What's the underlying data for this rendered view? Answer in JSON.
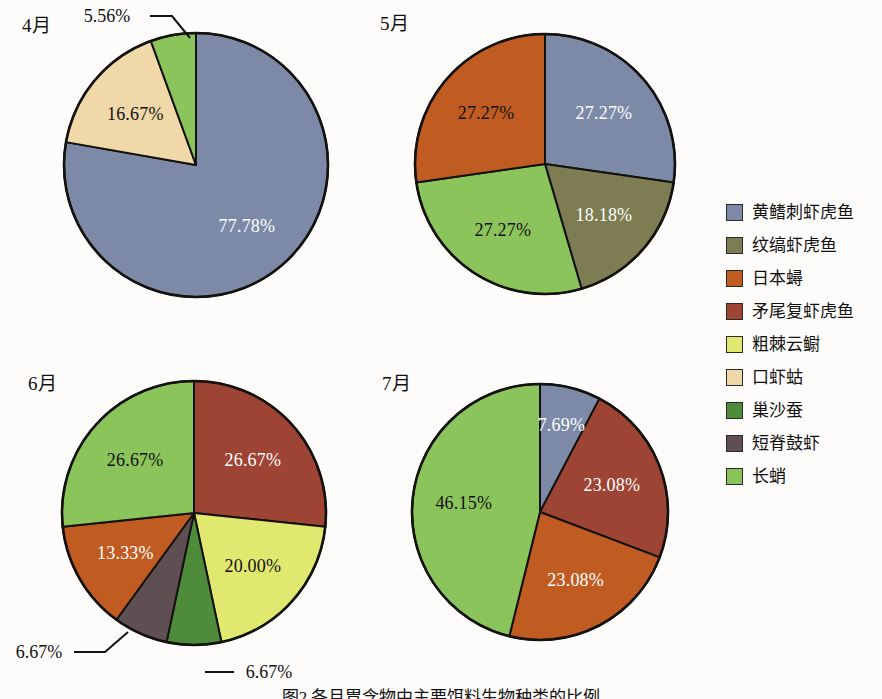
{
  "figure": {
    "caption": "图2  各月胃含物中主要饵料生物种类的比例",
    "legend_title": ""
  },
  "legend": {
    "items": [
      {
        "label": "黄鳍刺虾虎鱼",
        "color": "#7c8aa8"
      },
      {
        "label": "纹缟虾虎鱼",
        "color": "#7d7c52"
      },
      {
        "label": "日本蟳",
        "color": "#c05c22"
      },
      {
        "label": "矛尾复虾虎鱼",
        "color": "#9e4434"
      },
      {
        "label": "粗棘云鳚",
        "color": "#e0e870"
      },
      {
        "label": "口虾蛄",
        "color": "#f0d8a8"
      },
      {
        "label": "巢沙蚕",
        "color": "#4e8c3c"
      },
      {
        "label": "短脊鼓虾",
        "color": "#5f4f52"
      },
      {
        "label": "长蛸",
        "color": "#8cc45c"
      }
    ]
  },
  "chart_data": [
    {
      "type": "pie",
      "title": "4月",
      "labels": [
        "黄鳍刺虾虎鱼",
        "口虾蛄",
        "长蛸"
      ],
      "values": [
        77.78,
        16.67,
        5.56
      ],
      "value_labels": [
        "77.78%",
        "16.67%",
        "5.56%"
      ],
      "colors": [
        "#7c8aa8",
        "#f0d8a8",
        "#8cc45c"
      ],
      "label_placement": [
        "inside",
        "inside",
        "callout"
      ],
      "label_color": [
        "light",
        "dark",
        "dark"
      ],
      "start_angle_deg": 0,
      "direction": "clockwise"
    },
    {
      "type": "pie",
      "title": "5月",
      "labels": [
        "黄鳍刺虾虎鱼",
        "纹缟虾虎鱼",
        "长蛸",
        "日本蟳"
      ],
      "values": [
        27.27,
        18.18,
        27.27,
        27.27
      ],
      "value_labels": [
        "27.27%",
        "18.18%",
        "27.27%",
        "27.27%"
      ],
      "colors": [
        "#7c8aa8",
        "#7d7c52",
        "#8cc45c",
        "#c05c22"
      ],
      "label_placement": [
        "inside",
        "inside",
        "inside",
        "inside"
      ],
      "label_color": [
        "light",
        "light",
        "dark",
        "dark"
      ],
      "start_angle_deg": 0,
      "direction": "clockwise"
    },
    {
      "type": "pie",
      "title": "6月",
      "labels": [
        "矛尾复虾虎鱼",
        "粗棘云鳚",
        "巢沙蚕",
        "短脊鼓虾",
        "日本蟳",
        "长蛸"
      ],
      "values": [
        26.67,
        20.0,
        6.67,
        6.67,
        13.33,
        26.67
      ],
      "value_labels": [
        "26.67%",
        "20.00%",
        "6.67%",
        "6.67%",
        "13.33%",
        "26.67%"
      ],
      "colors": [
        "#9e4434",
        "#e0e870",
        "#4e8c3c",
        "#5f4f52",
        "#c05c22",
        "#8cc45c"
      ],
      "label_placement": [
        "inside",
        "inside",
        "callout",
        "callout",
        "inside",
        "inside"
      ],
      "label_color": [
        "light",
        "dark",
        "dark",
        "dark",
        "light",
        "dark"
      ],
      "start_angle_deg": 0,
      "direction": "clockwise"
    },
    {
      "type": "pie",
      "title": "7月",
      "labels": [
        "黄鳍刺虾虎鱼",
        "矛尾复虾虎鱼",
        "日本蟳",
        "长蛸"
      ],
      "values": [
        7.69,
        23.08,
        23.08,
        46.15
      ],
      "value_labels": [
        "7.69%",
        "23.08%",
        "23.08%",
        "46.15%"
      ],
      "colors": [
        "#7c8aa8",
        "#9e4434",
        "#c05c22",
        "#8cc45c"
      ],
      "label_placement": [
        "inside",
        "inside",
        "inside",
        "inside"
      ],
      "label_color": [
        "light",
        "light",
        "light",
        "dark"
      ],
      "start_angle_deg": 0,
      "direction": "clockwise"
    }
  ],
  "panels": [
    {
      "month": "4月",
      "month_x": 22,
      "month_y": 10,
      "cx": 196,
      "cy": 165,
      "r": 132
    },
    {
      "month": "5月",
      "month_x": 380,
      "month_y": 8,
      "cx": 545,
      "cy": 164,
      "r": 130
    },
    {
      "month": "6月",
      "month_x": 28,
      "month_y": 368,
      "cx": 194,
      "cy": 513,
      "r": 132
    },
    {
      "month": "7月",
      "month_x": 382,
      "month_y": 368,
      "cx": 540,
      "cy": 512,
      "r": 128
    }
  ],
  "callouts": [
    {
      "text": "5.56%",
      "x": 107,
      "y": 16,
      "line": "M 150 16 L 172 16 L 190 38"
    },
    {
      "text": "6.67%",
      "x": 39,
      "y": 652,
      "line": "M 74 652 L 105 652 L 128 632"
    },
    {
      "text": "6.67%",
      "x": 269,
      "y": 672,
      "line": "M 205 672 L 234 672"
    }
  ]
}
